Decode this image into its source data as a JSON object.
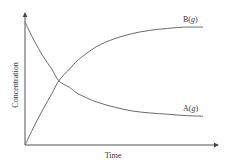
{
  "chart_data": {
    "type": "line",
    "title": "",
    "xlabel": "Time",
    "ylabel": "Concentration",
    "xlim": [
      0,
      1
    ],
    "ylim": [
      0,
      1
    ],
    "grid": false,
    "axis_ticks": false,
    "legend": "inline labels at right end of curves",
    "annotations": [
      "B(g)",
      "A(g)"
    ],
    "x": [
      0,
      0.05,
      0.1,
      0.15,
      0.19,
      0.25,
      0.3,
      0.4,
      0.5,
      0.6,
      0.7,
      0.8,
      0.9,
      1.0
    ],
    "series": [
      {
        "name": "A(g)",
        "label": "A(g)",
        "behavior": "exponential decay",
        "values": [
          0.94,
          0.8,
          0.68,
          0.58,
          0.49,
          0.44,
          0.39,
          0.33,
          0.29,
          0.26,
          0.245,
          0.235,
          0.225,
          0.22
        ]
      },
      {
        "name": "B(g)",
        "label": "B(g)",
        "behavior": "rise to plateau",
        "values": [
          0.0,
          0.14,
          0.27,
          0.39,
          0.49,
          0.58,
          0.65,
          0.75,
          0.81,
          0.85,
          0.875,
          0.89,
          0.9,
          0.9
        ]
      }
    ]
  },
  "labels": {
    "x_axis": "Time",
    "y_axis": "Concentration",
    "series_b_name": "B(",
    "series_b_italic": "g",
    "series_b_close": ")",
    "series_a_name": "A(",
    "series_a_italic": "g",
    "series_a_close": ")"
  }
}
